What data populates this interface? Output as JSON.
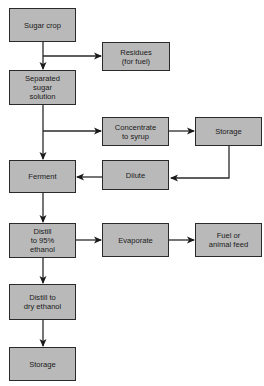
{
  "diagram": {
    "colors": {
      "box_fill": "#b9b9b9",
      "box_border": "#2a2a2a",
      "line": "#2a2a2a",
      "background": "#ffffff"
    },
    "nodes": {
      "sugar_crop": {
        "label": "Sugar crop"
      },
      "residues": {
        "label": "Residues\n(for fuel)"
      },
      "separated_sugar": {
        "label": "Separated\nsugar\nsolution"
      },
      "concentrate": {
        "label": "Concentrate\nto syrup"
      },
      "storage_syrup": {
        "label": "Storage"
      },
      "ferment": {
        "label": "Ferment"
      },
      "dilute": {
        "label": "Dilute"
      },
      "distill_95": {
        "label": "Distill\nto 95%\nethanol"
      },
      "evaporate": {
        "label": "Evaporate"
      },
      "fuel_feed": {
        "label": "Fuel or\nanimal feed"
      },
      "distill_dry": {
        "label": "Distill to\ndry ethanol"
      },
      "storage_final": {
        "label": "Storage"
      }
    },
    "edges": [
      {
        "from": "Sugar crop",
        "to": "Separated sugar solution"
      },
      {
        "from": "Sugar crop",
        "to": "Residues (for fuel)"
      },
      {
        "from": "Separated sugar solution",
        "to": "Ferment"
      },
      {
        "from": "Separated sugar solution",
        "to": "Concentrate to syrup"
      },
      {
        "from": "Concentrate to syrup",
        "to": "Storage"
      },
      {
        "from": "Storage",
        "to": "Dilute"
      },
      {
        "from": "Dilute",
        "to": "Ferment"
      },
      {
        "from": "Ferment",
        "to": "Distill to 95% ethanol"
      },
      {
        "from": "Distill to 95% ethanol",
        "to": "Evaporate"
      },
      {
        "from": "Evaporate",
        "to": "Fuel or animal feed"
      },
      {
        "from": "Distill to 95% ethanol",
        "to": "Distill to dry ethanol"
      },
      {
        "from": "Distill to dry ethanol",
        "to": "Storage"
      }
    ]
  }
}
